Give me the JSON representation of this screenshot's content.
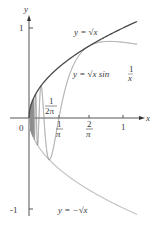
{
  "figure": {
    "axes": {
      "x_label": "x",
      "y_label": "y",
      "origin_label": "0",
      "y_ticks": [
        {
          "value": 1,
          "label": "1"
        },
        {
          "value": -1,
          "label": "-1"
        }
      ],
      "x_ticks": [
        {
          "value": 0.3183,
          "num": "1",
          "den": "π"
        },
        {
          "value": 0.6366,
          "num": "2",
          "den": "π"
        },
        {
          "value": 1,
          "label": "1"
        }
      ],
      "annotation": {
        "num": "1",
        "den": "2π"
      }
    },
    "curves": [
      {
        "name": "upper",
        "label": "y = √x",
        "color": "#4a4a4a"
      },
      {
        "name": "oscillating",
        "label": "y = √x sin 1/x",
        "color": "#8a8a8a"
      },
      {
        "name": "lower",
        "label": "y = −√x",
        "color": "#bdbdbd"
      }
    ],
    "labels": {
      "upper": "y = √x",
      "osc_main": "y = √x sin ",
      "osc_frac_num": "1",
      "osc_frac_den": "x",
      "lower": "y = −√x"
    }
  }
}
